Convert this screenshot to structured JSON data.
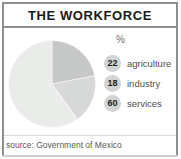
{
  "header": {
    "title": "THE WORKFORCE"
  },
  "legend": {
    "unit_header": "%",
    "items": [
      {
        "value": "22",
        "label": "agriculture"
      },
      {
        "value": "18",
        "label": "industry"
      },
      {
        "value": "60",
        "label": "services"
      }
    ]
  },
  "footer": {
    "source": "source: Government of Mexico"
  },
  "colors": {
    "slice_agriculture": "#c6c8c7",
    "slice_industry": "#d7d9d8",
    "slice_services": "#eaecea",
    "badge": "#d2d4d3",
    "frame": "#8d8f8e"
  },
  "chart_data": {
    "type": "pie",
    "title": "THE WORKFORCE",
    "unit": "%",
    "categories": [
      "agriculture",
      "industry",
      "services"
    ],
    "values": [
      22,
      18,
      60
    ],
    "colors": [
      "#c6c8c7",
      "#d7d9d8",
      "#eaecea"
    ],
    "start_angle_deg": 0,
    "direction": "clockwise",
    "legend_position": "right",
    "grid": false,
    "source": "source: Government of Mexico"
  }
}
